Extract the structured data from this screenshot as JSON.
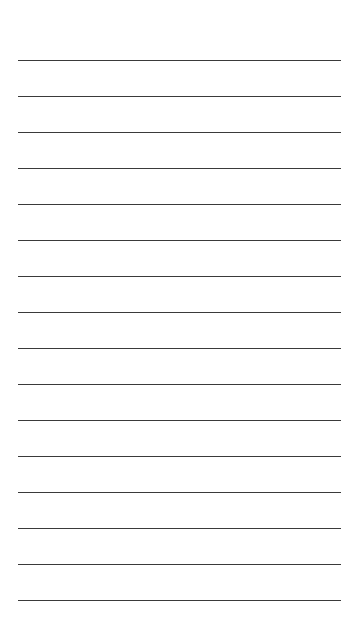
{
  "sheet": {
    "background": "#ffffff",
    "line_color": "#3a3a3a",
    "line_count": 16,
    "first_line_y": 60,
    "line_spacing": 36,
    "line_left": 18,
    "line_width": 323
  }
}
